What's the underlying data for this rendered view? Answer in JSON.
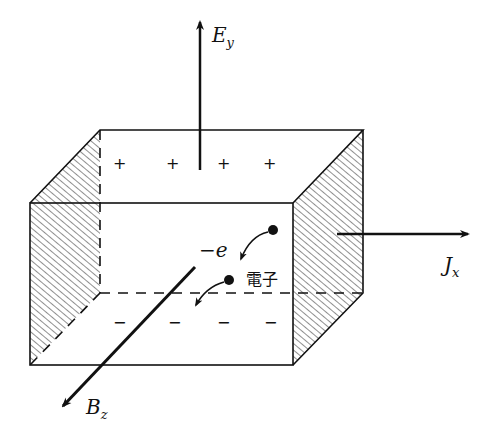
{
  "diagram": {
    "labels": {
      "electric_field": {
        "main": "E",
        "sub": "y"
      },
      "current": {
        "main": "J",
        "sub": "x"
      },
      "magnetic_field": {
        "main": "B",
        "sub": "z"
      },
      "charge": "−e",
      "electron": "電子"
    },
    "top_charges": [
      "+",
      "+",
      "+",
      "+"
    ],
    "bottom_charges": [
      "−",
      "−",
      "−",
      "−"
    ],
    "colors": {
      "line": "#111111",
      "background": "#ffffff"
    }
  }
}
